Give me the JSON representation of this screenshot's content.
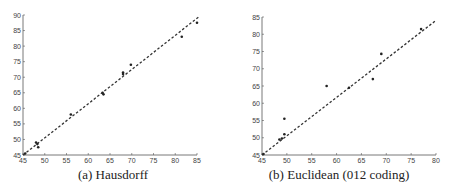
{
  "chart_data": [
    {
      "type": "scatter",
      "title": "(a) Hausdorff",
      "caption": "(a) Hausdorff",
      "xlabel": "",
      "ylabel": "",
      "xlim": [
        45,
        85
      ],
      "ylim": [
        45,
        90
      ],
      "xticks": [
        45,
        50,
        55,
        60,
        65,
        70,
        75,
        80,
        85
      ],
      "yticks": [
        45,
        50,
        55,
        60,
        65,
        70,
        75,
        80,
        85,
        90
      ],
      "grid": false,
      "series": [
        {
          "name": "points",
          "x": [
            45.5,
            48.0,
            48.3,
            48.5,
            56.0,
            63.3,
            63.5,
            68.0,
            68.0,
            69.8,
            81.5,
            85.0
          ],
          "y": [
            45.5,
            49.0,
            48.5,
            47.5,
            58.0,
            65.0,
            64.5,
            71.5,
            71.0,
            74.0,
            83.0,
            87.5
          ]
        },
        {
          "name": "fit line (dashed)",
          "x": [
            45,
            85.5
          ],
          "y": [
            45,
            89.5
          ]
        }
      ]
    },
    {
      "type": "scatter",
      "title": "(b) Euclidean (012 coding)",
      "caption": "(b) Euclidean (012 coding)",
      "xlabel": "",
      "ylabel": "",
      "xlim": [
        45,
        80
      ],
      "ylim": [
        45,
        85
      ],
      "xticks": [
        45,
        50,
        55,
        60,
        65,
        70,
        75,
        80
      ],
      "yticks": [
        45,
        50,
        55,
        60,
        65,
        70,
        75,
        80,
        85
      ],
      "grid": false,
      "series": [
        {
          "name": "points",
          "x": [
            45.3,
            48.5,
            49.0,
            49.5,
            49.5,
            58.0,
            62.5,
            67.3,
            69.0,
            77.0
          ],
          "y": [
            45.3,
            49.5,
            49.8,
            51.0,
            55.5,
            65.0,
            64.5,
            67.0,
            74.3,
            81.5
          ]
        },
        {
          "name": "fit line (dashed)",
          "x": [
            45,
            80
          ],
          "y": [
            45,
            84
          ]
        }
      ]
    }
  ],
  "captions": {
    "a": "(a) Hausdorff",
    "b": "(b) Euclidean (012 coding)"
  }
}
